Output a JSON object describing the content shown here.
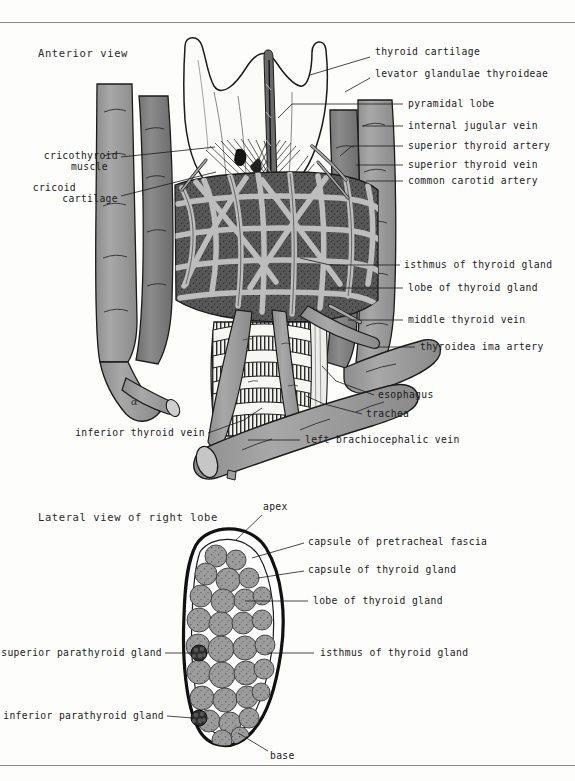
{
  "plate": {
    "width": 575,
    "height": 781,
    "background": "#fdfdfc",
    "rule_color": "#8b8b8b",
    "artist_mark": "α"
  },
  "palette": {
    "ink": "#1b1b1b",
    "vessel_gray": "#9a9a9a",
    "vessel_dark_gray": "#7b7b7b",
    "vessel_light_gray": "#b5b5b5",
    "cartilage_white": "#fbfbf9",
    "gland_gray": "#9c9c9c",
    "plexus_dark": "#4a4a4a",
    "parathyroid_dark": "#2e2e2e"
  },
  "views": [
    {
      "id": "anterior",
      "title": "Anterior view",
      "title_pos": {
        "x": 38,
        "y": 47
      },
      "labels_right": [
        {
          "id": "thyroid-cartilage",
          "text": "thyroid cartilage",
          "x": 375,
          "y": 52,
          "leader": [
            [
              370,
              57
            ],
            [
              310,
              75
            ]
          ]
        },
        {
          "id": "levator-glandulae",
          "text": "levator glandulae thyroideae",
          "x": 375,
          "y": 73,
          "leader": [
            [
              370,
              78
            ],
            [
              345,
              92
            ]
          ]
        },
        {
          "id": "pyramidal-lobe",
          "text": "pyramidal lobe",
          "x": 408,
          "y": 100,
          "leader": [
            [
              403,
              104
            ],
            [
              292,
              104
            ]
          ]
        },
        {
          "id": "internal-jugular-vein",
          "text": "internal jugular vein",
          "x": 408,
          "y": 122,
          "leader": [
            [
              403,
              126
            ],
            [
              362,
              126
            ]
          ]
        },
        {
          "id": "superior-thyroid-artery",
          "text": "superior thyroid artery",
          "x": 408,
          "y": 142,
          "leader": [
            [
              403,
              146
            ],
            [
              352,
              146
            ]
          ]
        },
        {
          "id": "superior-thyroid-vein",
          "text": "superior thyroid vein",
          "x": 408,
          "y": 161,
          "leader": [
            [
              403,
              165
            ],
            [
              356,
              165
            ]
          ]
        },
        {
          "id": "common-carotid-artery",
          "text": "common carotid artery",
          "x": 408,
          "y": 177,
          "leader": [
            [
              403,
              181
            ],
            [
              366,
              181
            ]
          ]
        },
        {
          "id": "isthmus-of-thyroid-gland",
          "text": "isthmus of thyroid gland",
          "x": 404,
          "y": 261,
          "leader": [
            [
              400,
              265
            ],
            [
              330,
              265
            ]
          ]
        },
        {
          "id": "lobe-of-thyroid-gland",
          "text": "lobe of thyroid gland",
          "x": 408,
          "y": 284,
          "leader": [
            [
              403,
              288
            ],
            [
              330,
              288
            ]
          ]
        },
        {
          "id": "middle-thyroid-vein",
          "text": "middle thyroid vein",
          "x": 408,
          "y": 316,
          "leader": [
            [
              403,
              320
            ],
            [
              345,
              320
            ]
          ]
        },
        {
          "id": "thyroidea-ima-artery",
          "text": "thyroidea ima artery",
          "x": 420,
          "y": 343,
          "leader": [
            [
              415,
              347
            ],
            [
              378,
              347
            ]
          ]
        },
        {
          "id": "esophagus",
          "text": "esophagus",
          "x": 378,
          "y": 391,
          "leader": [
            [
              374,
              395
            ],
            [
              330,
              370
            ]
          ]
        },
        {
          "id": "trachea",
          "text": "trachea",
          "x": 366,
          "y": 410,
          "leader": [
            [
              362,
              414
            ],
            [
              318,
              400
            ]
          ]
        },
        {
          "id": "left-brachiocephalic-vein",
          "text": "left brachiocephalic vein",
          "x": 305,
          "y": 436,
          "leader": [
            [
              300,
              440
            ],
            [
              248,
              440
            ]
          ]
        }
      ],
      "labels_left": [
        {
          "id": "cricothyroid-muscle",
          "text": "cricothyroid",
          "text2": "muscle",
          "x": 27,
          "y": 151,
          "leader": [
            [
              121,
              157
            ],
            [
              215,
              147
            ]
          ]
        },
        {
          "id": "cricoid-cartilage",
          "text": "cricoid",
          "text2": "cartilage",
          "x": 27,
          "y": 183,
          "leader": [
            [
              121,
              196
            ],
            [
              216,
              172
            ]
          ]
        },
        {
          "id": "inferior-thyroid-vein",
          "text": "inferior thyroid vein",
          "x": 76,
          "y": 429,
          "leader": [
            [
              208,
              433
            ],
            [
              260,
              410
            ]
          ]
        }
      ]
    },
    {
      "id": "lateral",
      "title": "Lateral view of right lobe",
      "title_pos": {
        "x": 38,
        "y": 511
      },
      "labels_right": [
        {
          "id": "apex",
          "text": "apex",
          "x": 263,
          "y": 507,
          "leader": [
            [
              262,
              515
            ],
            [
              236,
              540
            ]
          ]
        },
        {
          "id": "capsule-of-pretracheal-fascia",
          "text": "capsule of pretracheal fascia",
          "x": 308,
          "y": 538,
          "leader": [
            [
              304,
              543
            ],
            [
              252,
              558
            ]
          ]
        },
        {
          "id": "capsule-of-thyroid-gland",
          "text": "capsule of thyroid gland",
          "x": 308,
          "y": 566,
          "leader": [
            [
              304,
              571
            ],
            [
              256,
              577
            ]
          ]
        },
        {
          "id": "lobe-of-thyroid-gland-lat",
          "text": "lobe of thyroid gland",
          "x": 313,
          "y": 597,
          "leader": [
            [
              308,
              601
            ],
            [
              245,
              601
            ]
          ]
        },
        {
          "id": "isthmus-of-thyroid-gland-lat",
          "text": "isthmus of thyroid gland",
          "x": 320,
          "y": 649,
          "leader": [
            [
              314,
              653
            ],
            [
              268,
              653
            ]
          ]
        }
      ],
      "labels_left": [
        {
          "id": "superior-parathyroid-gland",
          "text": "superior parathyroid gland",
          "x": 23,
          "y": 649,
          "leader": [
            [
              165,
              653
            ],
            [
              196,
              653
            ]
          ]
        },
        {
          "id": "inferior-parathyroid-gland",
          "text": "inferior parathyroid gland",
          "x": 23,
          "y": 712,
          "leader": [
            [
              167,
              716
            ],
            [
              195,
              719
            ]
          ]
        }
      ],
      "labels_bottom": [
        {
          "id": "base",
          "text": "base",
          "x": 270,
          "y": 753,
          "leader": [
            [
              268,
              751
            ],
            [
              238,
              733
            ]
          ]
        }
      ]
    }
  ]
}
